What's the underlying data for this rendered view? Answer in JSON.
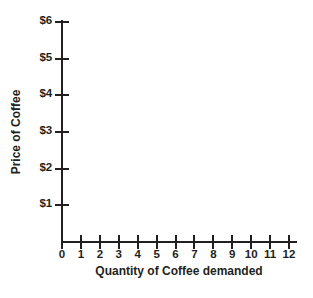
{
  "chart_data": {
    "type": "scatter",
    "title": "",
    "subtitle": "",
    "xlabel": "Quantity of Coffee demanded",
    "ylabel": "Price of Coffee",
    "x": [],
    "values": [],
    "series": [],
    "annotations": [],
    "legend": [],
    "legend_position": "none",
    "grid": false,
    "xlim": [
      0,
      12
    ],
    "ylim": [
      0,
      6
    ],
    "x_tick_labels": [
      "0",
      "1",
      "2",
      "3",
      "4",
      "5",
      "6",
      "7",
      "8",
      "9",
      "10",
      "11",
      "12"
    ],
    "x_tick_values": [
      0,
      1,
      2,
      3,
      4,
      5,
      6,
      7,
      8,
      9,
      10,
      11,
      12
    ],
    "y_tick_labels": [
      "$1",
      "$2",
      "$3",
      "$4",
      "$5",
      "$6"
    ],
    "y_tick_values": [
      1,
      2,
      3,
      4,
      5,
      6
    ],
    "note": "Empty plotting grid with no data plotted"
  },
  "colors": {
    "background": "#ffffff",
    "axis": "#231f20",
    "text": "#231f20"
  }
}
